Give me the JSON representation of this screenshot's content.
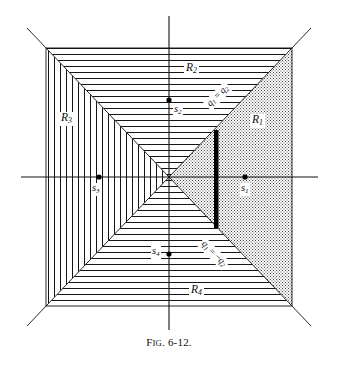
{
  "figure": {
    "caption_prefix": "F",
    "caption_smallcaps": "IG",
    "caption_number": ". 6-12.",
    "caption_full": "Fig. 6-12.",
    "colors": {
      "line": "#111111",
      "axis": "#111111",
      "hatch": "#1a1a1a",
      "stipple": "#3a3a3a",
      "bar": "#000000",
      "background": "#ffffff"
    },
    "geometry": {
      "square_left": 46,
      "square_top": 48,
      "square_right": 292,
      "square_bottom": 306,
      "center_x": 169,
      "center_y": 177,
      "axis_h_left": 21,
      "axis_h_right": 318,
      "axis_v_top": 16,
      "axis_v_bottom": 330,
      "diag_extend": 26,
      "bar_x": 216,
      "bar_top": 130,
      "bar_bottom": 228,
      "bar_width": 4
    },
    "regions": [
      {
        "id": "R1",
        "label": "R",
        "subscript": "1",
        "fill": "stipple",
        "position": "right",
        "label_x": 252,
        "label_y": 122
      },
      {
        "id": "R2",
        "label": "R",
        "subscript": "2",
        "fill": "horizontal-hatch",
        "position": "top",
        "label_x": 187,
        "label_y": 70
      },
      {
        "id": "R3",
        "label": "R",
        "subscript": "3",
        "fill": "vertical-hatch",
        "position": "left",
        "label_x": 62,
        "label_y": 120
      },
      {
        "id": "R4",
        "label": "R",
        "subscript": "4",
        "fill": "horizontal-hatch",
        "position": "bottom",
        "label_x": 192,
        "label_y": 291
      }
    ],
    "sources": [
      {
        "id": "s1",
        "label": "s",
        "subscript": "1",
        "point_x": 245,
        "point_y": 177,
        "label_x": 241,
        "label_y": 183,
        "label_side": "below"
      },
      {
        "id": "s2",
        "label": "s",
        "subscript": "2",
        "point_x": 169,
        "point_y": 100,
        "label_x": 174,
        "label_y": 105,
        "label_side": "below-right"
      },
      {
        "id": "s3",
        "label": "s",
        "subscript": "3",
        "point_x": 99,
        "point_y": 177,
        "label_x": 92,
        "label_y": 183,
        "label_side": "below"
      },
      {
        "id": "s4",
        "label": "s",
        "subscript": "4",
        "point_x": 169,
        "point_y": 254,
        "label_x": 152,
        "label_y": 247,
        "label_side": "left"
      }
    ],
    "diagonal_labels": [
      {
        "id": "q1-eq-q2",
        "text_lead": "q",
        "sub_lead": "1",
        "operator": " = ",
        "text_trail": "q",
        "sub_trail": "2",
        "full": "q1 = q2",
        "x": 219,
        "y": 97,
        "rotation": -45
      },
      {
        "id": "q1-eq-neg-q2",
        "text_lead": "q",
        "sub_lead": "1",
        "operator": " = −",
        "text_trail": "q",
        "sub_trail": "2",
        "full": "q1 = −q2",
        "x": 214,
        "y": 256,
        "rotation": 45
      }
    ]
  }
}
